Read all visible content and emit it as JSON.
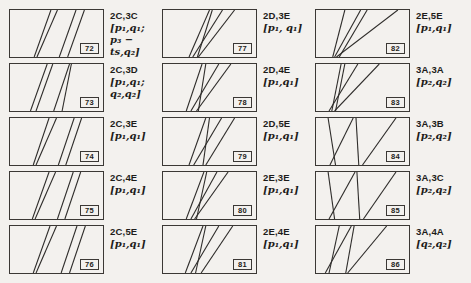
{
  "page": {
    "background": "#f3f1ee",
    "line_color": "#2e2c2a",
    "border_color": "#3b3835"
  },
  "cells": [
    {
      "number": "72",
      "code": "2C,3C",
      "math": "[p₁,q₁;\np₃ − ts,q₂]",
      "lines": [
        [
          26,
          100,
          44,
          0
        ],
        [
          29,
          100,
          51,
          0
        ],
        [
          53,
          100,
          71,
          0
        ],
        [
          62,
          100,
          80,
          0
        ]
      ]
    },
    {
      "number": "73",
      "code": "2C,3D",
      "math": "[p₁,q₁;\nq₂,q₂]",
      "lines": [
        [
          22,
          100,
          40,
          0
        ],
        [
          28,
          100,
          46,
          0
        ],
        [
          47,
          100,
          64,
          0
        ],
        [
          56,
          100,
          66,
          0
        ]
      ]
    },
    {
      "number": "74",
      "code": "2C,3E",
      "math": "[p₁,q₁]",
      "lines": [
        [
          25,
          100,
          42,
          0
        ],
        [
          28,
          100,
          50,
          0
        ],
        [
          52,
          100,
          69,
          0
        ],
        [
          60,
          100,
          77,
          0
        ]
      ]
    },
    {
      "number": "75",
      "code": "2C,4E",
      "math": "[p₁,q₁]",
      "lines": [
        [
          24,
          100,
          42,
          0
        ],
        [
          27,
          100,
          49,
          0
        ],
        [
          51,
          100,
          68,
          0
        ],
        [
          59,
          100,
          76,
          0
        ]
      ]
    },
    {
      "number": "76",
      "code": "2C,5E",
      "math": "[p₁,q₁]",
      "lines": [
        [
          25,
          100,
          43,
          0
        ],
        [
          28,
          100,
          50,
          0
        ],
        [
          55,
          100,
          72,
          0
        ],
        [
          64,
          100,
          81,
          0
        ]
      ]
    },
    {
      "number": "77",
      "code": "2D,3E",
      "math": "[p₁, q₁]",
      "lines": [
        [
          28,
          100,
          50,
          0
        ],
        [
          37,
          100,
          53,
          0
        ],
        [
          32,
          100,
          64,
          0
        ],
        [
          38,
          100,
          77,
          0
        ]
      ]
    },
    {
      "number": "78",
      "code": "2D,4E",
      "math": "[p₁,q₁]",
      "lines": [
        [
          25,
          100,
          42,
          0
        ],
        [
          38,
          100,
          46,
          0
        ],
        [
          30,
          100,
          60,
          0
        ],
        [
          36,
          100,
          73,
          0
        ]
      ]
    },
    {
      "number": "79",
      "code": "2D,5E",
      "math": "[p₁,q₁]",
      "lines": [
        [
          28,
          100,
          46,
          0
        ],
        [
          43,
          100,
          50,
          0
        ],
        [
          33,
          100,
          63,
          0
        ],
        [
          46,
          100,
          77,
          0
        ]
      ]
    },
    {
      "number": "80",
      "code": "2E,3E",
      "math": "[p₁,q₁]",
      "lines": [
        [
          25,
          100,
          44,
          0
        ],
        [
          36,
          100,
          47,
          0
        ],
        [
          30,
          100,
          58,
          0
        ],
        [
          34,
          100,
          70,
          0
        ]
      ]
    },
    {
      "number": "81",
      "code": "2E,4E",
      "math": "[p₁,q₁]",
      "lines": [
        [
          24,
          100,
          43,
          0
        ],
        [
          35,
          100,
          46,
          0
        ],
        [
          30,
          100,
          60,
          0
        ],
        [
          41,
          100,
          75,
          0
        ]
      ]
    },
    {
      "number": "82",
      "code": "2E,5E",
      "math": "[p₁,q₁]",
      "lines": [
        [
          18,
          100,
          31,
          0
        ],
        [
          20,
          100,
          48,
          0
        ],
        [
          25,
          100,
          55,
          0
        ],
        [
          22,
          100,
          88,
          0
        ]
      ]
    },
    {
      "number": "83",
      "code": "3A,3A",
      "math": "[p₂,q₂]",
      "lines": [
        [
          17,
          100,
          27,
          0
        ],
        [
          21,
          100,
          31,
          0
        ],
        [
          14,
          100,
          45,
          0
        ],
        [
          20,
          100,
          68,
          0
        ]
      ]
    },
    {
      "number": "84",
      "code": "3A,3B",
      "math": "[p₂,q₂]",
      "lines": [
        [
          21,
          100,
          13,
          0
        ],
        [
          15,
          100,
          40,
          0
        ],
        [
          46,
          100,
          43,
          0
        ],
        [
          50,
          100,
          86,
          0
        ]
      ]
    },
    {
      "number": "85",
      "code": "3A,3C",
      "math": "[p₂,q₂]",
      "lines": [
        [
          20,
          100,
          13,
          0
        ],
        [
          14,
          100,
          42,
          0
        ],
        [
          47,
          100,
          44,
          0
        ],
        [
          51,
          100,
          86,
          0
        ]
      ]
    },
    {
      "number": "86",
      "code": "3A,4A",
      "math": "[q₂,q₂]",
      "lines": [
        [
          14,
          100,
          25,
          0
        ],
        [
          10,
          100,
          38,
          0
        ],
        [
          32,
          100,
          41,
          0
        ],
        [
          34,
          100,
          76,
          0
        ]
      ]
    }
  ]
}
